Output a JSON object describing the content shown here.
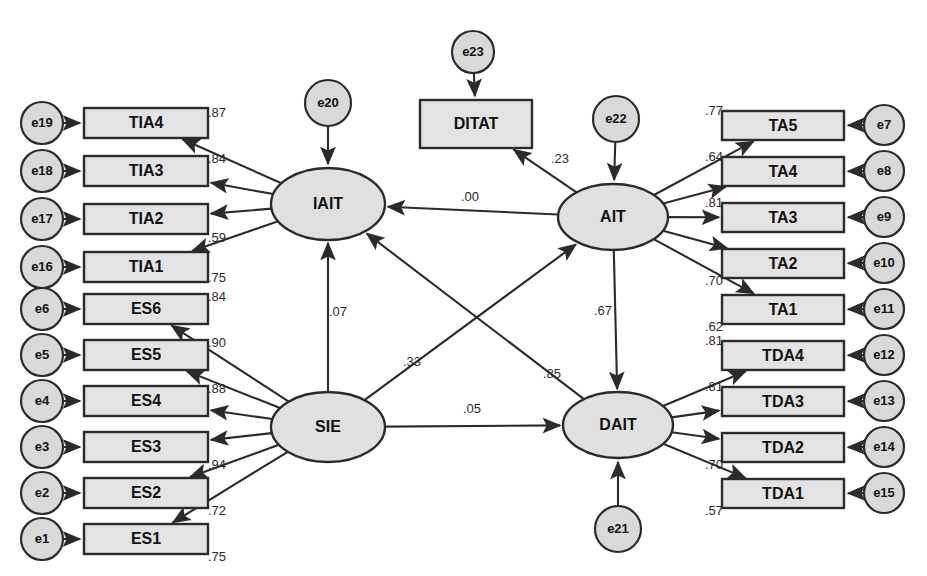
{
  "diagram": {
    "type": "structural-equation-model-path-diagram",
    "latent_variables": [
      {
        "id": "IAIT",
        "label": "IAIT",
        "cx": 328,
        "cy": 204,
        "rx": 57,
        "ry": 36
      },
      {
        "id": "SIE",
        "label": "SIE",
        "cx": 328,
        "cy": 427,
        "rx": 57,
        "ry": 35
      },
      {
        "id": "AIT",
        "label": "AIT",
        "cx": 613,
        "cy": 217,
        "rx": 55,
        "ry": 33
      },
      {
        "id": "DAIT",
        "label": "DAIT",
        "cx": 618,
        "cy": 425,
        "rx": 55,
        "ry": 33
      }
    ],
    "observed_boxes": [
      {
        "id": "TIA4",
        "label": "TIA4",
        "x": 84,
        "y": 108,
        "w": 124,
        "h": 30
      },
      {
        "id": "TIA3",
        "label": "TIA3",
        "x": 84,
        "y": 156,
        "w": 124,
        "h": 30
      },
      {
        "id": "TIA2",
        "label": "TIA2",
        "x": 84,
        "y": 204,
        "w": 124,
        "h": 30
      },
      {
        "id": "TIA1",
        "label": "TIA1",
        "x": 84,
        "y": 252,
        "w": 124,
        "h": 30
      },
      {
        "id": "ES6",
        "label": "ES6",
        "x": 84,
        "y": 294,
        "w": 124,
        "h": 30
      },
      {
        "id": "ES5",
        "label": "ES5",
        "x": 84,
        "y": 340,
        "w": 124,
        "h": 30
      },
      {
        "id": "ES4",
        "label": "ES4",
        "x": 84,
        "y": 386,
        "w": 124,
        "h": 30
      },
      {
        "id": "ES3",
        "label": "ES3",
        "x": 84,
        "y": 432,
        "w": 124,
        "h": 30
      },
      {
        "id": "ES2",
        "label": "ES2",
        "x": 84,
        "y": 478,
        "w": 124,
        "h": 30
      },
      {
        "id": "ES1",
        "label": "ES1",
        "x": 84,
        "y": 524,
        "w": 124,
        "h": 30
      },
      {
        "id": "DITAT",
        "label": "DITAT",
        "x": 420,
        "y": 100,
        "w": 112,
        "h": 48
      },
      {
        "id": "TA5",
        "label": "TA5",
        "x": 722,
        "y": 111,
        "w": 122,
        "h": 29
      },
      {
        "id": "TA4",
        "label": "TA4",
        "x": 722,
        "y": 157,
        "w": 122,
        "h": 29
      },
      {
        "id": "TA3",
        "label": "TA3",
        "x": 722,
        "y": 203,
        "w": 122,
        "h": 29
      },
      {
        "id": "TA2",
        "label": "TA2",
        "x": 722,
        "y": 249,
        "w": 122,
        "h": 29
      },
      {
        "id": "TA1",
        "label": "TA1",
        "x": 722,
        "y": 295,
        "w": 122,
        "h": 29
      },
      {
        "id": "TDA4",
        "label": "TDA4",
        "x": 722,
        "y": 341,
        "w": 122,
        "h": 29
      },
      {
        "id": "TDA3",
        "label": "TDA3",
        "x": 722,
        "y": 387,
        "w": 122,
        "h": 29
      },
      {
        "id": "TDA2",
        "label": "TDA2",
        "x": 722,
        "y": 433,
        "w": 122,
        "h": 29
      },
      {
        "id": "TDA1",
        "label": "TDA1",
        "x": 722,
        "y": 479,
        "w": 122,
        "h": 29
      }
    ],
    "error_terms": [
      {
        "id": "e19",
        "label": "e19",
        "cx": 42,
        "cy": 123,
        "r": 21
      },
      {
        "id": "e18",
        "label": "e18",
        "cx": 42,
        "cy": 171,
        "r": 21
      },
      {
        "id": "e17",
        "label": "e17",
        "cx": 42,
        "cy": 219,
        "r": 21
      },
      {
        "id": "e16",
        "label": "e16",
        "cx": 42,
        "cy": 267,
        "r": 21
      },
      {
        "id": "e6",
        "label": "e6",
        "cx": 42,
        "cy": 309,
        "r": 21
      },
      {
        "id": "e5",
        "label": "e5",
        "cx": 42,
        "cy": 355,
        "r": 21
      },
      {
        "id": "e4",
        "label": "e4",
        "cx": 42,
        "cy": 401,
        "r": 21
      },
      {
        "id": "e3",
        "label": "e3",
        "cx": 42,
        "cy": 447,
        "r": 21
      },
      {
        "id": "e2",
        "label": "e2",
        "cx": 42,
        "cy": 493,
        "r": 21
      },
      {
        "id": "e1",
        "label": "e1",
        "cx": 42,
        "cy": 539,
        "r": 21
      },
      {
        "id": "e20",
        "label": "e20",
        "cx": 328,
        "cy": 103,
        "r": 23
      },
      {
        "id": "e23",
        "label": "e23",
        "cx": 473,
        "cy": 52,
        "r": 21
      },
      {
        "id": "e22",
        "label": "e22",
        "cx": 616,
        "cy": 119,
        "r": 23
      },
      {
        "id": "e21",
        "label": "e21",
        "cx": 618,
        "cy": 529,
        "r": 23
      },
      {
        "id": "e7",
        "label": "e7",
        "cx": 884,
        "cy": 125,
        "r": 20
      },
      {
        "id": "e8",
        "label": "e8",
        "cx": 884,
        "cy": 171,
        "r": 20
      },
      {
        "id": "e9",
        "label": "e9",
        "cx": 884,
        "cy": 217,
        "r": 20
      },
      {
        "id": "e10",
        "label": "e10",
        "cx": 884,
        "cy": 263,
        "r": 20
      },
      {
        "id": "e11",
        "label": "e11",
        "cx": 884,
        "cy": 309,
        "r": 20
      },
      {
        "id": "e12",
        "label": "e12",
        "cx": 884,
        "cy": 355,
        "r": 20
      },
      {
        "id": "e13",
        "label": "e13",
        "cx": 884,
        "cy": 401,
        "r": 20
      },
      {
        "id": "e14",
        "label": "e14",
        "cx": 884,
        "cy": 447,
        "r": 20
      },
      {
        "id": "e15",
        "label": "e15",
        "cx": 884,
        "cy": 493,
        "r": 20
      }
    ],
    "measurement_paths": [
      {
        "from": "IAIT",
        "to": "TIA4",
        "coefficient": ".87",
        "label_x": 217,
        "label_y": 114,
        "anchor": "start"
      },
      {
        "from": "IAIT",
        "to": "TIA3",
        "coefficient": ".84",
        "label_x": 217,
        "label_y": 160,
        "anchor": "start"
      },
      {
        "from": "IAIT",
        "to": "TIA2",
        "coefficient": ".59",
        "label_x": 217,
        "label_y": 239,
        "anchor": "start"
      },
      {
        "from": "IAIT",
        "to": "TIA1",
        "coefficient": ".75",
        "label_x": 217,
        "label_y": 279,
        "anchor": "start"
      },
      {
        "from": "SIE",
        "to": "ES6",
        "coefficient": ".84",
        "label_x": 217,
        "label_y": 298,
        "anchor": "start"
      },
      {
        "from": "SIE",
        "to": "ES5",
        "coefficient": ".90",
        "label_x": 217,
        "label_y": 344,
        "anchor": "start"
      },
      {
        "from": "SIE",
        "to": "ES4",
        "coefficient": ".88",
        "label_x": 217,
        "label_y": 390,
        "anchor": "start"
      },
      {
        "from": "SIE",
        "to": "ES3",
        "coefficient": ".94",
        "label_x": 217,
        "label_y": 466,
        "anchor": "start"
      },
      {
        "from": "SIE",
        "to": "ES2",
        "coefficient": ".72",
        "label_x": 217,
        "label_y": 512,
        "anchor": "start"
      },
      {
        "from": "SIE",
        "to": "ES1",
        "coefficient": ".75",
        "label_x": 217,
        "label_y": 558,
        "anchor": "start"
      },
      {
        "from": "AIT",
        "to": "TA5",
        "coefficient": ".77",
        "label_x": 714,
        "label_y": 112,
        "anchor": "end"
      },
      {
        "from": "AIT",
        "to": "TA4",
        "coefficient": ".64",
        "label_x": 714,
        "label_y": 158,
        "anchor": "end"
      },
      {
        "from": "AIT",
        "to": "TA3",
        "coefficient": ".81",
        "label_x": 714,
        "label_y": 204,
        "anchor": "end"
      },
      {
        "from": "AIT",
        "to": "TA2",
        "coefficient": ".70",
        "label_x": 714,
        "label_y": 282,
        "anchor": "end"
      },
      {
        "from": "AIT",
        "to": "TA1",
        "coefficient": ".62",
        "label_x": 714,
        "label_y": 328,
        "anchor": "end"
      },
      {
        "from": "DAIT",
        "to": "TDA4",
        "coefficient": ".81",
        "label_x": 714,
        "label_y": 342,
        "anchor": "end"
      },
      {
        "from": "DAIT",
        "to": "TDA3",
        "coefficient": ".81",
        "label_x": 714,
        "label_y": 388,
        "anchor": "end"
      },
      {
        "from": "DAIT",
        "to": "TDA2",
        "coefficient": ".70",
        "label_x": 714,
        "label_y": 466,
        "anchor": "end"
      },
      {
        "from": "DAIT",
        "to": "TDA1",
        "coefficient": ".57",
        "label_x": 714,
        "label_y": 512,
        "anchor": "end"
      },
      {
        "from": "AIT",
        "to": "DITAT",
        "coefficient": ".23",
        "label_x": 560,
        "label_y": 160,
        "anchor": "start"
      }
    ],
    "structural_paths": [
      {
        "from": "AIT",
        "to": "IAIT",
        "coefficient": ".00",
        "label_x": 470,
        "label_y": 198,
        "anchor": "middle"
      },
      {
        "from": "SIE",
        "to": "IAIT",
        "coefficient": ".07",
        "label_x": 338,
        "label_y": 313,
        "anchor": "start"
      },
      {
        "from": "SIE",
        "to": "AIT",
        "coefficient": ".33",
        "label_x": 412,
        "label_y": 363,
        "anchor": "middle"
      },
      {
        "from": "DAIT",
        "to": "IAIT",
        "coefficient": ".85",
        "label_x": 552,
        "label_y": 375,
        "anchor": "middle"
      },
      {
        "from": "SIE",
        "to": "DAIT",
        "coefficient": ".05",
        "label_x": 472,
        "label_y": 410,
        "anchor": "middle"
      },
      {
        "from": "AIT",
        "to": "DAIT",
        "coefficient": ".67",
        "label_x": 603,
        "label_y": 312,
        "anchor": "end"
      }
    ],
    "error_paths": [
      {
        "from": "e20",
        "to": "IAIT"
      },
      {
        "from": "e23",
        "to": "DITAT"
      },
      {
        "from": "e22",
        "to": "AIT"
      },
      {
        "from": "e21",
        "to": "DAIT"
      },
      {
        "from": "e19",
        "to": "TIA4"
      },
      {
        "from": "e18",
        "to": "TIA3"
      },
      {
        "from": "e17",
        "to": "TIA2"
      },
      {
        "from": "e16",
        "to": "TIA1"
      },
      {
        "from": "e6",
        "to": "ES6"
      },
      {
        "from": "e5",
        "to": "ES5"
      },
      {
        "from": "e4",
        "to": "ES4"
      },
      {
        "from": "e3",
        "to": "ES3"
      },
      {
        "from": "e2",
        "to": "ES2"
      },
      {
        "from": "e1",
        "to": "ES1"
      },
      {
        "from": "e7",
        "to": "TA5"
      },
      {
        "from": "e8",
        "to": "TA4"
      },
      {
        "from": "e9",
        "to": "TA3"
      },
      {
        "from": "e10",
        "to": "TA2"
      },
      {
        "from": "e11",
        "to": "TA1"
      },
      {
        "from": "e12",
        "to": "TDA4"
      },
      {
        "from": "e13",
        "to": "TDA3"
      },
      {
        "from": "e14",
        "to": "TDA2"
      },
      {
        "from": "e15",
        "to": "TDA1"
      }
    ],
    "colors": {
      "node_fill": "#e3e3e3",
      "ellipse_fill": "#e0e0e0",
      "error_fill": "#d9d9d9",
      "stroke": "#2b2b2b",
      "background": "#ffffff"
    }
  }
}
